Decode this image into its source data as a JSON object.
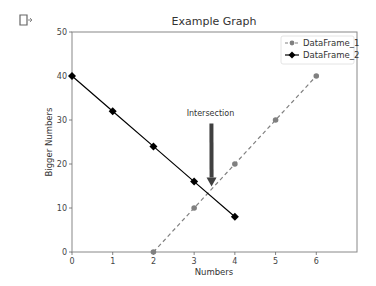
{
  "cell": {
    "output_icon": "cell-output-icon"
  },
  "chart_data": {
    "type": "line",
    "title": "Example Graph",
    "xlabel": "Numbers",
    "ylabel": "Bigger Numbers",
    "xlim": [
      0,
      7
    ],
    "ylim": [
      0,
      50
    ],
    "xticks": [
      0,
      1,
      2,
      3,
      4,
      5,
      6
    ],
    "yticks": [
      0,
      10,
      20,
      30,
      40,
      50
    ],
    "grid": false,
    "legend_position": "upper right",
    "series": [
      {
        "name": "DataFrame_1",
        "x": [
          2,
          3,
          4,
          5,
          6
        ],
        "values": [
          0,
          10,
          20,
          30,
          40
        ],
        "linestyle": "dashed",
        "marker": "circle",
        "color": "#808080"
      },
      {
        "name": "DataFrame_2",
        "x": [
          0,
          1,
          2,
          3,
          4
        ],
        "values": [
          40,
          32,
          24,
          16,
          8
        ],
        "linestyle": "solid",
        "marker": "diamond",
        "color": "#000000"
      }
    ],
    "annotations": [
      {
        "text": "Intersection",
        "text_xy": [
          3.4,
          31
        ],
        "arrow_to": [
          3.33,
          14
        ],
        "arrow_color": "#404040"
      }
    ]
  }
}
